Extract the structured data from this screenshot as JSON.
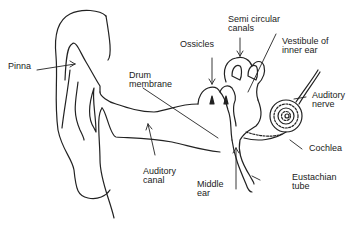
{
  "diagram": {
    "labels": {
      "pinna": "Pinna",
      "drum_membrane": "Drum\nmembrane",
      "ossicles": "Ossicles",
      "semi_circular_canals": "Semi circular\ncanals",
      "vestibule": "Vestibule of\ninner ear",
      "auditory_nerve": "Auditory\nnerve",
      "cochlea": "Cochlea",
      "auditory_canal": "Auditory\ncanal",
      "middle_ear": "Middle\near",
      "eustachian_tube": "Eustachian\ntube"
    },
    "colors": {
      "line": "#222222",
      "background": "#ffffff"
    }
  }
}
